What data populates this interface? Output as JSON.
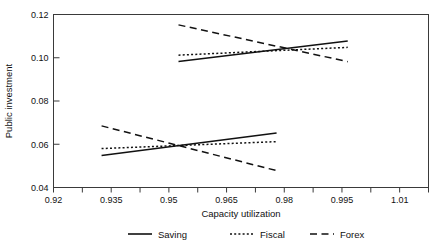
{
  "chart_data": {
    "type": "line",
    "title": "",
    "xlabel": "Capacity utilization",
    "ylabel": "Public investment",
    "xlim": [
      0.92,
      1.0175
    ],
    "ylim": [
      0.04,
      0.12
    ],
    "grid": false,
    "legend_position": "bottom",
    "x_major_ticks": [
      0.92,
      0.935,
      0.95,
      0.965,
      0.98,
      0.995,
      1.01
    ],
    "x_tick_labels": [
      "0.92",
      "0.935",
      "0.95",
      "0.965",
      "0.98",
      "0.995",
      "1.01"
    ],
    "x_minor_ticks": [
      0.9275,
      0.9425,
      0.9575,
      0.9725,
      0.9875,
      1.0025,
      1.0175
    ],
    "y_major_ticks": [
      0.04,
      0.06,
      0.08,
      0.1,
      0.12
    ],
    "y_tick_labels": [
      "0.04",
      "0.06",
      "0.08",
      "0.10",
      "0.12"
    ],
    "series": [
      {
        "name": "Saving",
        "style": "solid",
        "segments": [
          {
            "group": "lower",
            "x": [
              0.9325,
              0.978
            ],
            "y": [
              0.0548,
              0.0652
            ]
          },
          {
            "group": "upper",
            "x": [
              0.9525,
              0.9965
            ],
            "y": [
              0.0983,
              0.1078
            ]
          }
        ]
      },
      {
        "name": "Fiscal",
        "style": "dotted",
        "segments": [
          {
            "group": "lower",
            "x": [
              0.9325,
              0.978
            ],
            "y": [
              0.058,
              0.0612
            ]
          },
          {
            "group": "upper",
            "x": [
              0.9525,
              0.9965
            ],
            "y": [
              0.1012,
              0.1048
            ]
          }
        ]
      },
      {
        "name": "Forex",
        "style": "dashed",
        "segments": [
          {
            "group": "lower",
            "x": [
              0.9325,
              0.978
            ],
            "y": [
              0.0685,
              0.0478
            ]
          },
          {
            "group": "upper",
            "x": [
              0.9525,
              0.9965
            ],
            "y": [
              0.1152,
              0.0982
            ]
          }
        ]
      }
    ]
  },
  "legend": {
    "items": [
      {
        "label": "Saving",
        "style": "solid"
      },
      {
        "label": "Fiscal",
        "style": "dotted"
      },
      {
        "label": "Forex",
        "style": "dashed"
      }
    ]
  },
  "colors": {
    "line": "#111111",
    "axis": "#3a3a3a",
    "background": "#ffffff"
  }
}
